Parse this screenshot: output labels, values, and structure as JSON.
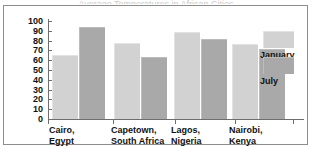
{
  "chart_data": {
    "type": "bar",
    "title": "",
    "xlabel": "",
    "ylabel": "",
    "ylim": [
      0,
      100
    ],
    "ytick_labels": [
      "100",
      "90",
      "80",
      "70",
      "60",
      "50",
      "40",
      "30",
      "20",
      "10",
      "0"
    ],
    "ytick_values": [
      100,
      90,
      80,
      70,
      60,
      50,
      40,
      30,
      20,
      10,
      0
    ],
    "grid": false,
    "legend_position": "right",
    "categories": [
      "Cairo,\nEgypt",
      "Capetown,\nSouth Africa",
      "Lagos,\nNigeria",
      "Nairobi,\nKenya"
    ],
    "series": [
      {
        "name": "January",
        "color": "#d2d2d2",
        "values": [
          65,
          78,
          89,
          77
        ]
      },
      {
        "name": "July",
        "color": "#a9a9a9",
        "values": [
          94,
          63,
          82,
          71
        ]
      }
    ]
  },
  "legend": {
    "items": [
      {
        "label": "January",
        "color": "#d2d2d2"
      },
      {
        "label": "July",
        "color": "#a9a9a9"
      }
    ]
  },
  "title_strip": {
    "text": "Average Temperatures in African Cities"
  }
}
